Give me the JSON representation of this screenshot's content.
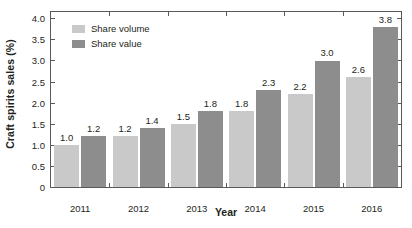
{
  "chart_data": {
    "type": "bar",
    "title": "",
    "subtitle": "",
    "xlabel": "Year",
    "ylabel": "Craft spirits sales (%)",
    "categories": [
      "2011",
      "2012",
      "2013",
      "2014",
      "2015",
      "2016"
    ],
    "series": [
      {
        "name": "Share volume",
        "color": "#c9c9c9",
        "values": [
          1.0,
          1.2,
          1.5,
          1.8,
          2.2,
          2.6
        ],
        "labels": [
          "1.0",
          "1.2",
          "1.5",
          "1.8",
          "2.2",
          "2.6"
        ]
      },
      {
        "name": "Share value",
        "color": "#8d8d8d",
        "values": [
          1.2,
          1.4,
          1.8,
          2.3,
          3.0,
          3.8
        ],
        "labels": [
          "1.2",
          "1.4",
          "1.8",
          "2.3",
          "3.0",
          "3.8"
        ]
      }
    ],
    "ylim": [
      0,
      4.15
    ],
    "yticks": [
      0,
      0.5,
      1.0,
      1.5,
      2.0,
      2.5,
      3.0,
      3.5,
      4.0
    ],
    "ytick_labels": [
      "0",
      "0.5",
      "1.0",
      "1.5",
      "2.0",
      "2.5",
      "3.0",
      "3.5",
      "4.0"
    ],
    "grid": false,
    "legend_position": "upper-left-inside",
    "frame": "full-box",
    "tick_direction": "inward",
    "axis_color": "#58595b",
    "background": "#ffffff"
  }
}
